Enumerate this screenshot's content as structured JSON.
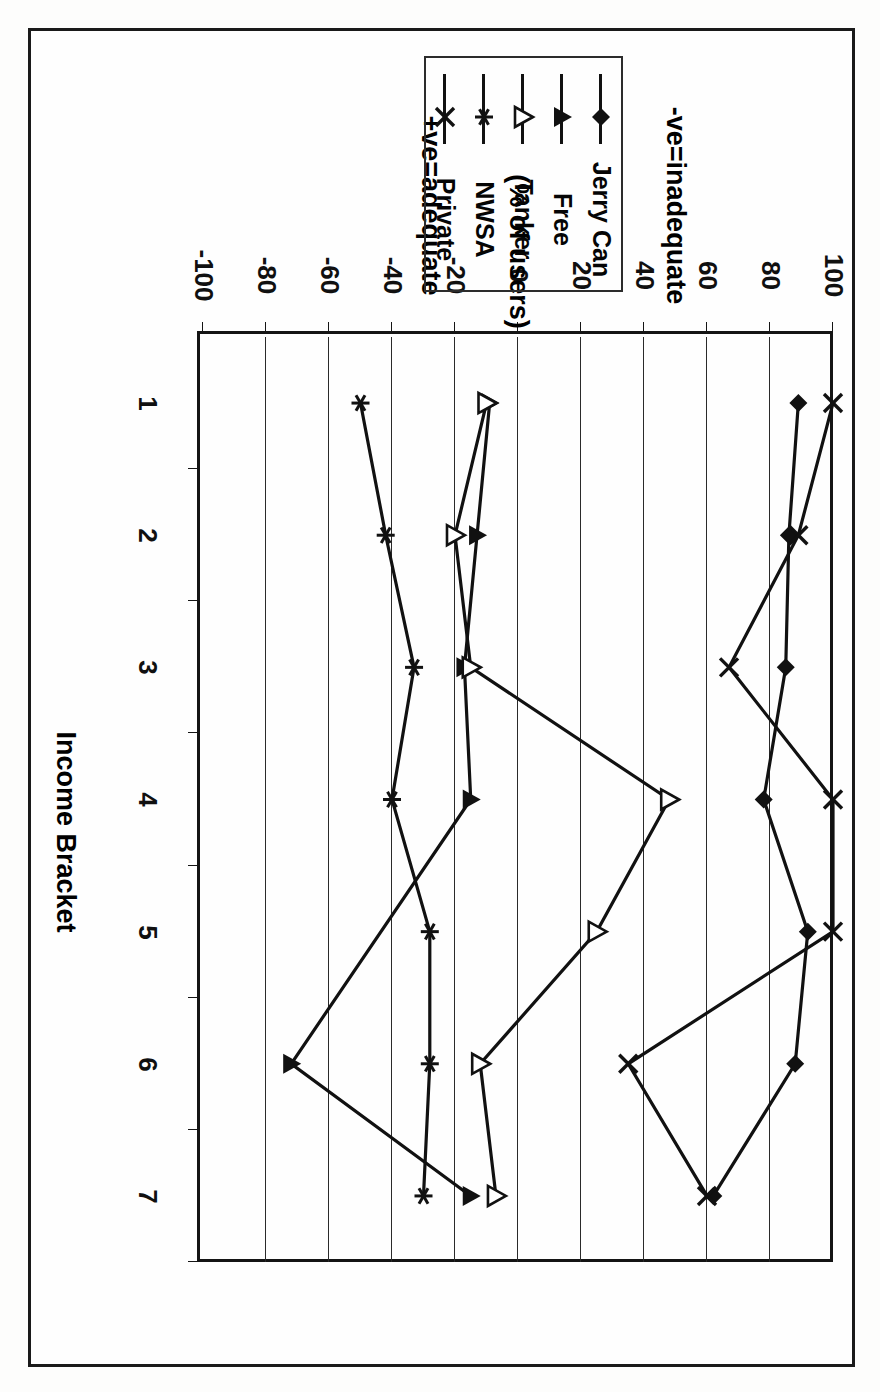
{
  "figure": {
    "background": "#fdfdfc",
    "ink_color": "#111111",
    "orientation_note": "scanned-180-rotated"
  },
  "chart_data": {
    "type": "line",
    "title": "",
    "xlabel": "Income Bracket",
    "ylabel": "(% of users)",
    "ylabel_positive": "+ve=adequate",
    "ylabel_negative": "-ve=inadequate",
    "categories": [
      "1",
      "2",
      "3",
      "4",
      "5",
      "6",
      "7"
    ],
    "x": [
      1,
      2,
      3,
      4,
      5,
      6,
      7
    ],
    "ylim": [
      -100,
      100
    ],
    "yticks": [
      100,
      80,
      60,
      40,
      20,
      0,
      -20,
      -40,
      -60,
      -80,
      -100
    ],
    "ytick_labels": [
      "100",
      "80",
      "60",
      "40",
      "20",
      "0",
      "-20",
      "-40",
      "-60",
      "-80",
      "-100"
    ],
    "grid": "vertical-only",
    "legend_position": "outside-top",
    "series": [
      {
        "name": "Jerry Can",
        "marker": "filled-diamond",
        "values": [
          89,
          86,
          85,
          78,
          92,
          88,
          62
        ]
      },
      {
        "name": "Free",
        "marker": "filled-triangle",
        "values": [
          -9,
          -13,
          -17,
          -15,
          null,
          -72,
          -15
        ]
      },
      {
        "name": "Tanker",
        "marker": "open-triangle",
        "values": [
          -10,
          -20,
          -15,
          48,
          25,
          -12,
          -7
        ]
      },
      {
        "name": "NWSA",
        "marker": "asterisk",
        "values": [
          -50,
          -42,
          -33,
          -40,
          -28,
          -28,
          -30
        ]
      },
      {
        "name": "Private",
        "marker": "cross-x",
        "values": [
          100,
          89,
          67,
          100,
          100,
          35,
          60
        ]
      }
    ]
  },
  "legend": {
    "items": [
      {
        "label": "Jerry Can",
        "marker": "filled-diamond"
      },
      {
        "label": "Free",
        "marker": "filled-triangle"
      },
      {
        "label": "Tanker",
        "marker": "open-triangle"
      },
      {
        "label": "NWSA",
        "marker": "asterisk"
      },
      {
        "label": "Private",
        "marker": "cross-x"
      }
    ]
  },
  "axes": {
    "x_title": "Income Bracket",
    "y_title_main": "(% of users)",
    "y_title_pos": "+ve=adequate",
    "y_title_neg": "-ve=inadequate",
    "category_labels": [
      "1",
      "2",
      "3",
      "4",
      "5",
      "6",
      "7"
    ],
    "value_labels": [
      "100",
      "80",
      "60",
      "40",
      "20",
      "0",
      "-20",
      "-40",
      "-60",
      "-80",
      "-100"
    ]
  }
}
